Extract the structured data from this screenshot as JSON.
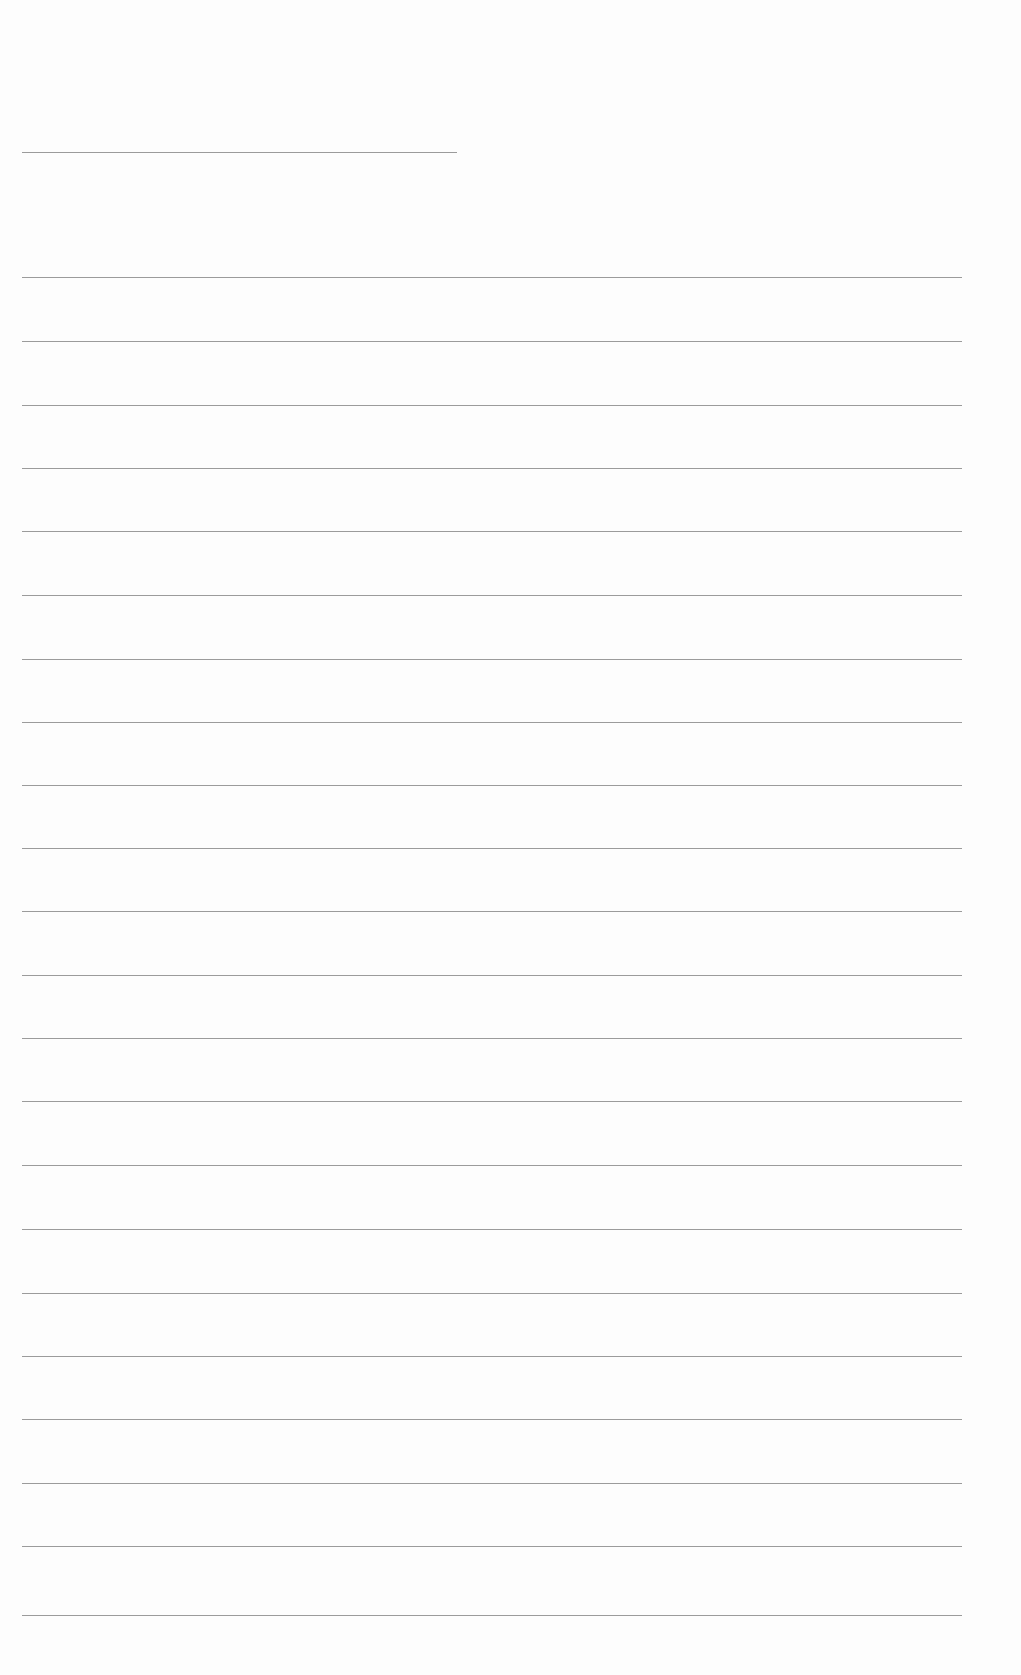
{
  "document": {
    "type": "blank lined paper",
    "background_color": "#fdfdfd",
    "line_color": "#8a8a8a",
    "header_line": {
      "y": 152,
      "x_start": 22,
      "x_end": 457
    },
    "ruled_lines": {
      "x_start": 22,
      "x_end": 962,
      "y_positions": [
        277,
        341,
        405,
        468,
        531,
        595,
        659,
        722,
        785,
        848,
        911,
        975,
        1038,
        1101,
        1165,
        1229,
        1293,
        1356,
        1419,
        1483,
        1546,
        1615
      ]
    }
  }
}
